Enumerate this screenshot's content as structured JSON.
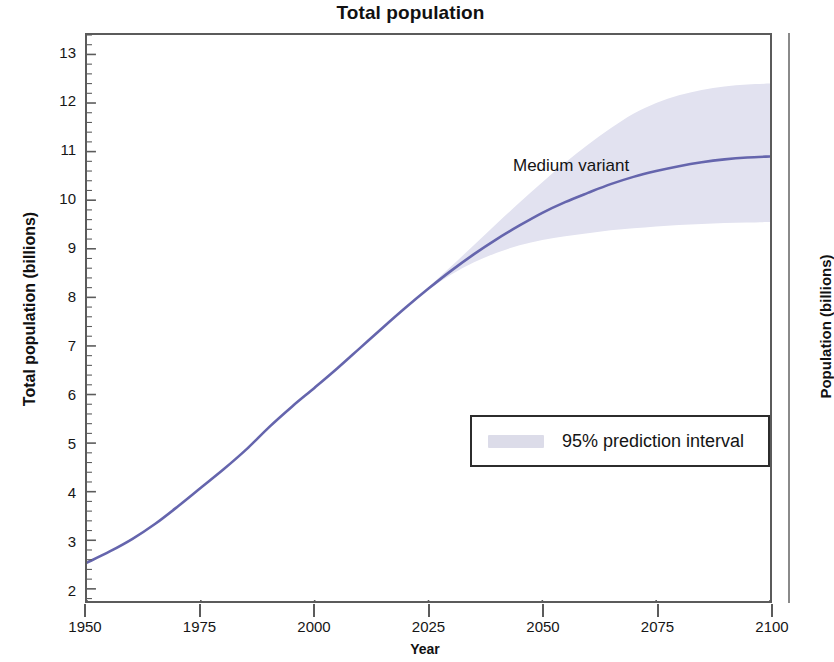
{
  "figure": {
    "title": "Total population",
    "annotation": "Medium variant",
    "right_panel_axis_title": "Population (billions)"
  },
  "legend": {
    "position": "inside-lower-right",
    "entries": [
      {
        "label": "95% prediction interval",
        "swatch": "#dcdce9",
        "type": "band"
      }
    ]
  },
  "colors": {
    "line": "#6565ad",
    "band": "#e2e2f0",
    "band_legend_swatch": "#dcdce9",
    "frame": "#5b5b5b",
    "text": "#141414",
    "background": "#ffffff"
  },
  "chart_data": {
    "type": "line",
    "title": "Total population",
    "xlabel": "Year",
    "ylabel": "Total population (billions)",
    "xlim": [
      1950,
      2100
    ],
    "ylim": [
      1.75,
      13.4
    ],
    "grid": false,
    "x_ticks": [
      1950,
      1975,
      2000,
      2025,
      2050,
      2075,
      2100
    ],
    "y_ticks": [
      2,
      3,
      4,
      5,
      6,
      7,
      8,
      9,
      10,
      11,
      12,
      13
    ],
    "y_minor_tick_step": 0.2,
    "legend_position": "inside lower right",
    "annotations": [
      {
        "text": "Medium variant",
        "x": 2053,
        "y": 10.55
      }
    ],
    "series": [
      {
        "name": "Medium variant",
        "color": "#6565ad",
        "x": [
          1950,
          1955,
          1960,
          1965,
          1970,
          1975,
          1980,
          1985,
          1990,
          1995,
          2000,
          2005,
          2010,
          2015,
          2020,
          2025,
          2030,
          2035,
          2040,
          2045,
          2050,
          2055,
          2060,
          2065,
          2070,
          2075,
          2080,
          2085,
          2090,
          2095,
          2100
        ],
        "values": [
          2.54,
          2.77,
          3.03,
          3.34,
          3.7,
          4.08,
          4.46,
          4.87,
          5.33,
          5.75,
          6.14,
          6.54,
          6.96,
          7.38,
          7.79,
          8.18,
          8.55,
          8.89,
          9.2,
          9.48,
          9.74,
          9.96,
          10.15,
          10.33,
          10.48,
          10.6,
          10.7,
          10.78,
          10.84,
          10.88,
          10.9
        ]
      }
    ],
    "bands": [
      {
        "name": "95% prediction interval",
        "color": "#e2e2f0",
        "x": [
          2020,
          2025,
          2030,
          2035,
          2040,
          2045,
          2050,
          2055,
          2060,
          2065,
          2070,
          2075,
          2080,
          2085,
          2090,
          2095,
          2100
        ],
        "lower": [
          7.79,
          8.16,
          8.47,
          8.72,
          8.92,
          9.07,
          9.18,
          9.26,
          9.32,
          9.38,
          9.42,
          9.46,
          9.49,
          9.51,
          9.53,
          9.54,
          9.55
        ],
        "upper": [
          7.79,
          8.21,
          8.64,
          9.08,
          9.52,
          9.95,
          10.37,
          10.77,
          11.14,
          11.48,
          11.78,
          12.0,
          12.16,
          12.27,
          12.34,
          12.38,
          12.4
        ]
      }
    ]
  },
  "axes": {
    "x_tick_labels": [
      "1950",
      "1975",
      "2000",
      "2025",
      "2050",
      "2075",
      "2100"
    ],
    "y_tick_labels": [
      "13",
      "12",
      "11",
      "10",
      "9",
      "8",
      "7",
      "6",
      "5",
      "4",
      "3",
      "2"
    ],
    "x_title": "Year",
    "y_title": "Total population (billions)"
  }
}
